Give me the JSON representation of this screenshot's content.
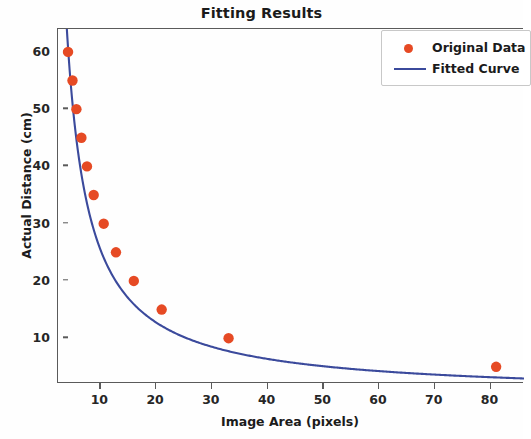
{
  "chart_data": {
    "type": "scatter",
    "title": "Fitting Results",
    "xlabel": "Image Area (pixels)",
    "ylabel": "Actual Distance (cm)",
    "xlim": [
      2.4,
      86
    ],
    "ylim": [
      2.0,
      64
    ],
    "grid": false,
    "legend_position": "upper right",
    "xticks": [
      10,
      20,
      30,
      40,
      50,
      60,
      70,
      80
    ],
    "yticks": [
      10,
      20,
      30,
      40,
      50,
      60
    ],
    "series": [
      {
        "name": "Original Data",
        "type": "scatter",
        "color": "#e64a24",
        "marker": "circle",
        "x": [
          4.2,
          5.0,
          5.7,
          6.6,
          7.6,
          8.8,
          10.6,
          12.8,
          16.0,
          21.0,
          33.0,
          81.0
        ],
        "y": [
          60,
          55,
          50,
          45,
          40,
          35,
          30,
          25,
          20,
          15,
          10,
          5
        ]
      },
      {
        "name": "Fitted Curve",
        "type": "line",
        "color": "#3b4a9c",
        "relationship": "y = k / x",
        "k": 255,
        "x": [
          4.0,
          4.5,
          5.0,
          5.7,
          6.6,
          7.6,
          8.8,
          10.6,
          12.8,
          16.0,
          21.0,
          26.0,
          33.0,
          42.0,
          52.0,
          62.0,
          72.0,
          81.0,
          86.0
        ],
        "y": [
          62.5,
          56.0,
          50.8,
          44.9,
          38.9,
          33.9,
          29.4,
          24.5,
          20.4,
          16.4,
          12.7,
          10.4,
          8.3,
          6.6,
          5.5,
          4.8,
          4.3,
          4.0,
          3.9
        ]
      }
    ]
  },
  "legend": {
    "items": [
      {
        "label": "Original Data",
        "key": "dot-marker"
      },
      {
        "label": "Fitted Curve",
        "key": "line-marker"
      }
    ]
  }
}
